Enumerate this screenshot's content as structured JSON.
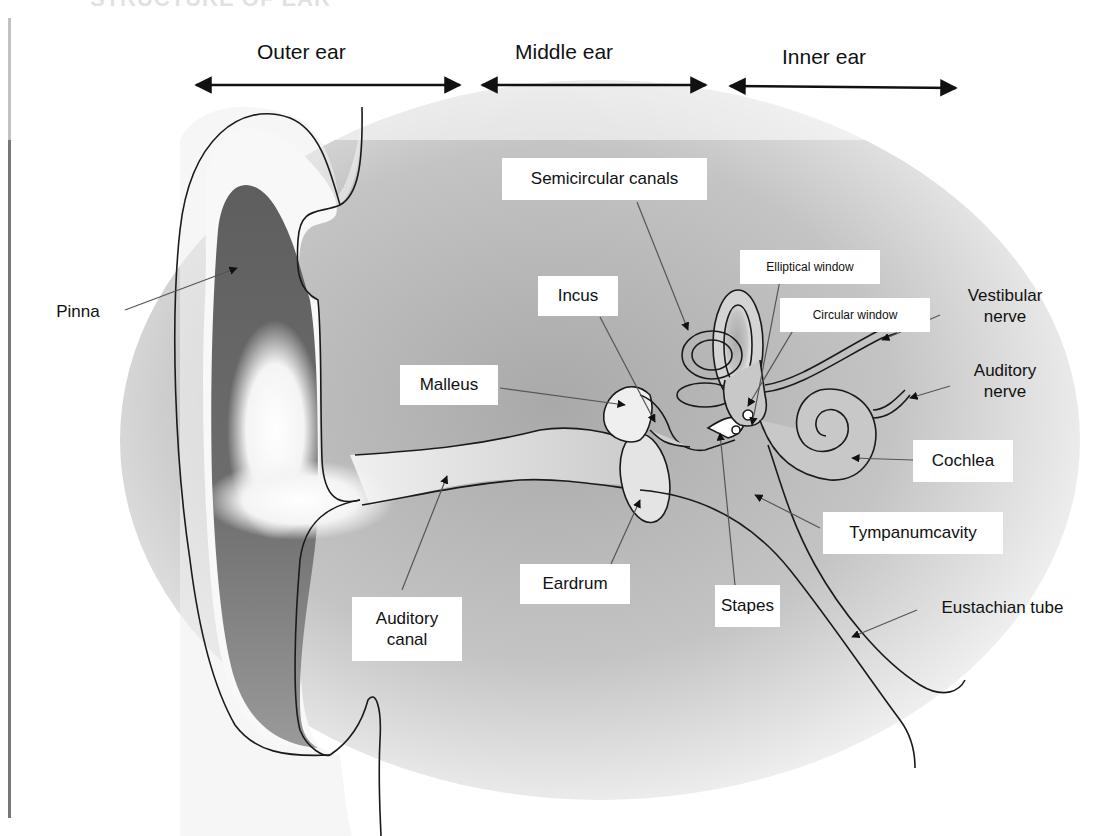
{
  "diagram": {
    "title_cut": "STRUCTURE OF EAR",
    "sections": [
      {
        "id": "outer",
        "label": "Outer ear"
      },
      {
        "id": "middle",
        "label": "Middle ear"
      },
      {
        "id": "inner",
        "label": "Inner ear"
      }
    ],
    "labels": {
      "pinna": "Pinna",
      "semicircular_canals": "Semicircular canals",
      "elliptical_window": "Elliptical window",
      "circular_window": "Circular window",
      "incus": "Incus",
      "malleus": "Malleus",
      "vestibular_nerve": "Vestibular\nnerve",
      "auditory_nerve": "Auditory\nnerve",
      "cochlea": "Cochlea",
      "tympanum_cavity": "Tympanumcavity",
      "eardrum": "Eardrum",
      "stapes": "Stapes",
      "eustachian_tube": "Eustachian tube",
      "auditory_canal": "Auditory\ncanal"
    },
    "colors": {
      "background": "#ffffff",
      "outline": "#1a1a1a",
      "pinna_dark": "#6b6b6b",
      "tissue_gray": "#bdbdbd",
      "leader_line": "#555555"
    }
  }
}
